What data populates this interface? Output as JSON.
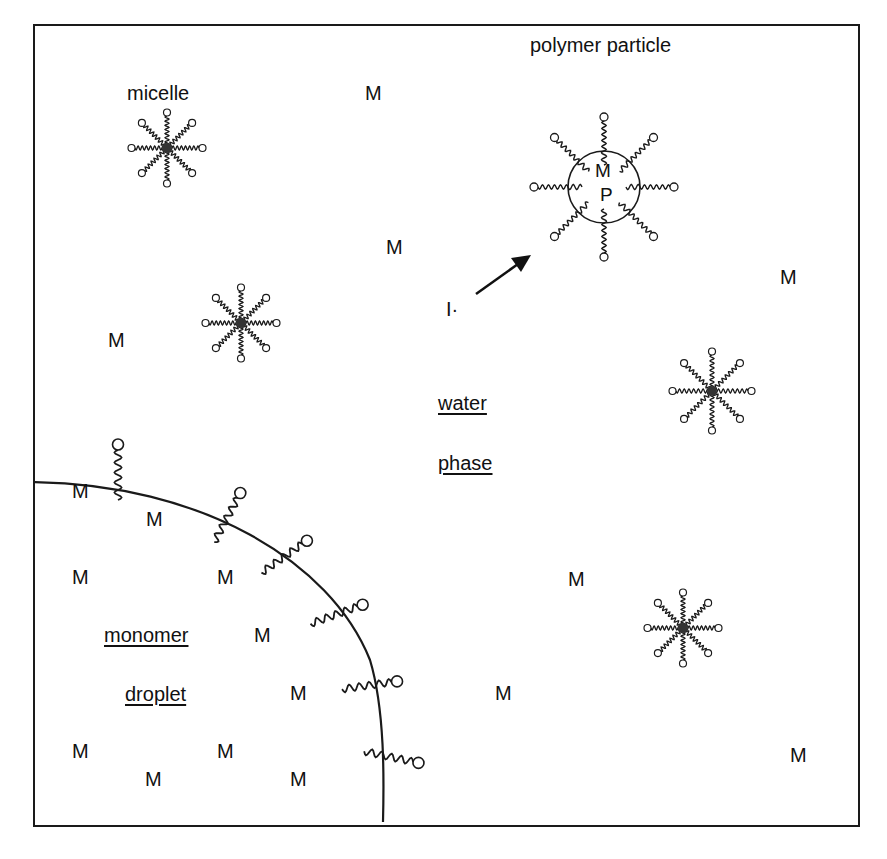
{
  "diagram": {
    "title_partial": "...polymerization scheme (cropped)",
    "labels": {
      "micelle": "micelle",
      "polymer_particle": "polymer particle",
      "initiator": "I·",
      "water": "water",
      "phase": "phase",
      "monomer": "monomer",
      "droplet": "droplet",
      "particle_M": "M",
      "particle_P": "P"
    },
    "monomer_symbol": "M",
    "monomers": [
      {
        "x": 365,
        "y": 82
      },
      {
        "x": 386,
        "y": 236
      },
      {
        "x": 780,
        "y": 266
      },
      {
        "x": 108,
        "y": 329
      },
      {
        "x": 72,
        "y": 480
      },
      {
        "x": 146,
        "y": 508
      },
      {
        "x": 72,
        "y": 566
      },
      {
        "x": 217,
        "y": 566
      },
      {
        "x": 568,
        "y": 568
      },
      {
        "x": 254,
        "y": 624
      },
      {
        "x": 290,
        "y": 682
      },
      {
        "x": 495,
        "y": 682
      },
      {
        "x": 72,
        "y": 740
      },
      {
        "x": 217,
        "y": 740
      },
      {
        "x": 790,
        "y": 744
      },
      {
        "x": 145,
        "y": 768
      },
      {
        "x": 290,
        "y": 768
      }
    ],
    "micelles": [
      {
        "cx": 167,
        "cy": 148,
        "r": 32
      },
      {
        "cx": 241,
        "cy": 323,
        "r": 32
      },
      {
        "cx": 712,
        "cy": 391,
        "r": 36
      },
      {
        "cx": 683,
        "cy": 628,
        "r": 32
      }
    ],
    "polymer_particle": {
      "cx": 604,
      "cy": 187,
      "r": 36
    },
    "droplet_surfactants": [
      {
        "x": 118,
        "y": 492,
        "angle": -90
      },
      {
        "x": 218,
        "y": 535,
        "angle": -62
      },
      {
        "x": 268,
        "y": 568,
        "angle": -35
      },
      {
        "x": 318,
        "y": 621,
        "angle": -20
      },
      {
        "x": 350,
        "y": 688,
        "angle": -8
      },
      {
        "x": 372,
        "y": 753,
        "angle": 12
      }
    ],
    "colors": {
      "line": "#1a1a1a",
      "background": "#ffffff"
    }
  }
}
